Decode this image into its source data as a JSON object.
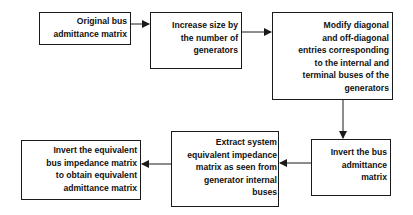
{
  "diagram": {
    "type": "flowchart",
    "nodes": [
      {
        "id": "n1",
        "label": "Original bus\nadmittance matrix"
      },
      {
        "id": "n2",
        "label": "Increase size by\nthe number of\ngenerators"
      },
      {
        "id": "n3",
        "label": "Modify diagonal\nand off-diagonal\nentries corresponding\nto the internal and\nterminal buses of the\ngenerators"
      },
      {
        "id": "n4",
        "label": "Invert the bus\nadmittance\nmatrix"
      },
      {
        "id": "n5",
        "label": "Extract system\nequivalent impedance\nmatrix as seen from\ngenerator internal\nbuses"
      },
      {
        "id": "n6",
        "label": "Invert the equivalent\nbus impedance matrix\nto obtain equivalent\nadmittance matrix"
      }
    ],
    "edges": [
      {
        "from": "n1",
        "to": "n2"
      },
      {
        "from": "n2",
        "to": "n3"
      },
      {
        "from": "n3",
        "to": "n4"
      },
      {
        "from": "n4",
        "to": "n5"
      },
      {
        "from": "n5",
        "to": "n6"
      }
    ],
    "colors": {
      "stroke": "#1a1a1a",
      "text": "#111111",
      "background": "#ffffff"
    }
  }
}
